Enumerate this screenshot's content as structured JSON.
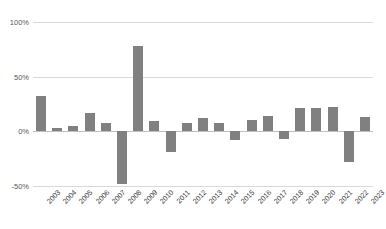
{
  "chart_data": {
    "type": "bar",
    "title": "",
    "xlabel": "",
    "ylabel": "",
    "ylim": [
      -50,
      100
    ],
    "grid": true,
    "legend": "none",
    "value_suffix": "%",
    "ytick_labels": [
      "100%",
      "50%",
      "0%",
      "-50%"
    ],
    "ytick_values": [
      100,
      50,
      0,
      -50
    ],
    "categories": [
      "2003",
      "2004",
      "2005",
      "2006",
      "2007",
      "2008",
      "2009",
      "2010",
      "2011",
      "2012",
      "2013",
      "2014",
      "2015",
      "2016",
      "2017",
      "2018",
      "2019",
      "2020",
      "2021",
      "2022",
      "2023"
    ],
    "values": [
      32,
      3,
      5,
      17,
      8,
      -48,
      78,
      9,
      -19,
      8,
      12,
      8,
      -8,
      10,
      14,
      -7,
      21,
      21,
      22,
      -28,
      13
    ],
    "series": [
      {
        "name": "Annual return",
        "color": "#808080",
        "values": [
          32,
          3,
          5,
          17,
          8,
          -48,
          78,
          9,
          -19,
          8,
          12,
          8,
          -8,
          10,
          14,
          -7,
          21,
          21,
          22,
          -28,
          13
        ]
      }
    ],
    "colors": {
      "bar": "#808080",
      "gridline": "#d9d9d9",
      "zero_line": "#bfbfbf",
      "tick_text": "#595959",
      "axis_text": "#404040",
      "background": "#ffffff"
    }
  }
}
